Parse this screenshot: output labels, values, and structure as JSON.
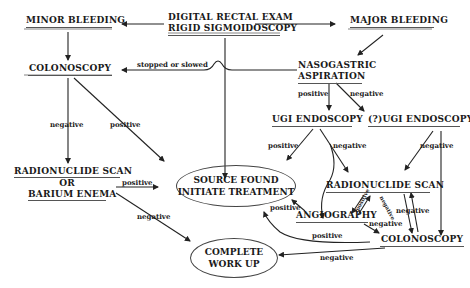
{
  "diagram": {
    "nodes": {
      "minor_bleeding": "MINOR BLEEDING",
      "dre_line1": "DIGITAL RECTAL EXAM",
      "dre_line2": "RIGID SIGMOIDOSCOPY",
      "major_bleeding": "MAJOR BLEEDING",
      "colonoscopy_left": "COLONOSCOPY",
      "ng_line1": "NASOGASTRIC",
      "ng_line2": "ASPIRATION",
      "ugi_endoscopy": "UGI ENDOSCOPY",
      "q_ugi_endoscopy": "(?)UGI ENDOSCOPY",
      "rn_left_line1": "RADIONUCLIDE SCAN",
      "rn_left_line2": "OR",
      "rn_left_line3": "BARIUM ENEMA",
      "source_line1": "SOURCE FOUND",
      "source_line2": "INITIATE TREATMENT",
      "rn_right": "RADIONUCLIDE SCAN",
      "angiography": "ANGIOGRAPHY",
      "colonoscopy_right": "COLONOSCOPY",
      "complete_line1": "COMPLETE",
      "complete_line2": "WORK UP"
    },
    "edge_labels": {
      "stopped_or_slowed": "stopped or slowed",
      "ng_positive": "positive",
      "ng_negative": "negative",
      "colo_negative": "negative",
      "colo_positive": "positive",
      "ugi_positive": "positive",
      "ugi_negative": "negative",
      "qugi_negative": "negative",
      "rnleft_positive": "positive",
      "rnleft_negative": "negative",
      "rn_angio_positive": "positive",
      "rn_angio_negative": "negative",
      "rn_colo_negative": "negative",
      "angio_positive": "positive",
      "angio_negative": "negative",
      "colo_right_positive": "positive",
      "colo_right_negative": "negative"
    }
  }
}
